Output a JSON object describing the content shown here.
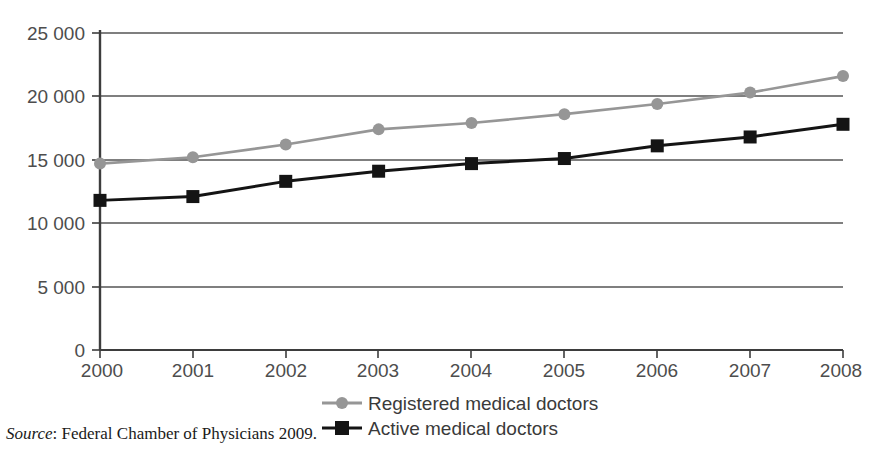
{
  "chart_data": {
    "type": "line",
    "title": "",
    "subtitle": "",
    "xlabel": "",
    "ylabel": "",
    "categories": [
      "2000",
      "2001",
      "2002",
      "2003",
      "2004",
      "2005",
      "2006",
      "2007",
      "2008"
    ],
    "x": [
      2000,
      2001,
      2002,
      2003,
      2004,
      2005,
      2006,
      2007,
      2008
    ],
    "series": [
      {
        "name": "Registered medical doctors",
        "values": [
          14700,
          15200,
          16200,
          17400,
          17900,
          18600,
          19400,
          20300,
          21600
        ],
        "color": "#969696",
        "marker": "circle"
      },
      {
        "name": "Active medical doctors",
        "values": [
          11800,
          12100,
          13300,
          14100,
          14700,
          15100,
          16100,
          16800,
          17800
        ],
        "color": "#141414",
        "marker": "square"
      }
    ],
    "ylim": [
      0,
      25000
    ],
    "xlim": [
      2000,
      2008
    ],
    "yticks": [
      0,
      5000,
      10000,
      15000,
      20000,
      25000
    ],
    "ytick_labels": [
      "0",
      "5 000",
      "10 000",
      "15 000",
      "20 000",
      "25 000"
    ],
    "xtick_labels": [
      "2000",
      "2001",
      "2002",
      "2003",
      "2004",
      "2005",
      "2006",
      "2007",
      "2008"
    ],
    "grid": "horizontal",
    "legend_position": "bottom-center",
    "annotations": []
  },
  "legend": {
    "items": [
      {
        "label": "Registered medical doctors",
        "color": "#969696",
        "marker": "circle"
      },
      {
        "label": "Active medical doctors",
        "color": "#141414",
        "marker": "square"
      }
    ]
  },
  "source": {
    "label": "Source",
    "separator": ":",
    "text": " Federal Chamber of Physicians 2009."
  },
  "colors": {
    "registered": "#969696",
    "active": "#141414",
    "axis": "#3d3d3d",
    "grid": "#555555",
    "tick_text": "#4d4d4d",
    "background": "#ffffff"
  }
}
